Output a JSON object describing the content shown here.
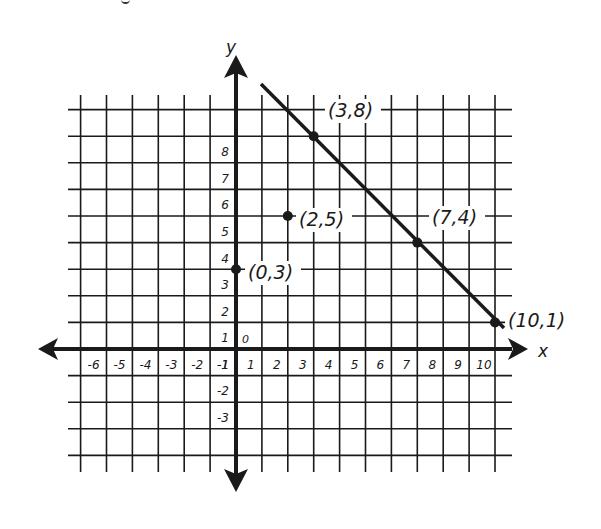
{
  "chart_data": {
    "type": "scatter",
    "title": "",
    "xlabel": "x",
    "ylabel": "y",
    "xlim": [
      -7,
      11
    ],
    "ylim": [
      -4,
      9
    ],
    "grid": true,
    "x_tick_labels": [
      "-6",
      "-5",
      "-4",
      "-3",
      "-2",
      "-1",
      "1",
      "2",
      "3",
      "4",
      "5",
      "6",
      "7",
      "8",
      "9",
      "10"
    ],
    "y_tick_labels": [
      "1",
      "2",
      "3",
      "4",
      "5",
      "6",
      "7",
      "8",
      "-1",
      "-2",
      "-3"
    ],
    "origin_label": "0",
    "points": [
      {
        "x": 0,
        "y": 3,
        "label": "(0,3)"
      },
      {
        "x": 2,
        "y": 5,
        "label": "(2,5)"
      },
      {
        "x": 3,
        "y": 8,
        "label": "(3,8)"
      },
      {
        "x": 7,
        "y": 4,
        "label": "(7,4)"
      },
      {
        "x": 10,
        "y": 1,
        "label": "(10,1)"
      }
    ],
    "series": [
      {
        "name": "line",
        "type": "line",
        "x": [
          3,
          7,
          10
        ],
        "y": [
          8,
          4,
          1
        ]
      }
    ]
  },
  "axes": {
    "x_label": "x",
    "y_label": "y",
    "origin": "0"
  },
  "colors": {
    "ink": "#1a1a1a",
    "background": "#ffffff"
  }
}
